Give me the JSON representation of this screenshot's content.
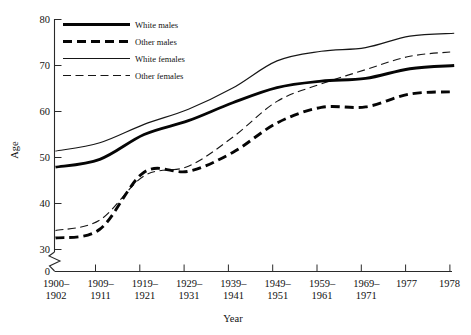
{
  "chart_data": {
    "type": "line",
    "title": "",
    "xlabel": "Year",
    "ylabel": "Age",
    "grid": false,
    "legend_position": "top-left-inside",
    "categories": [
      "1900–1902",
      "1909–1911",
      "1919–1921",
      "1929–1931",
      "1939–1941",
      "1949–1951",
      "1959–1961",
      "1969–1971",
      "1977",
      "1978"
    ],
    "ylim": [
      30,
      80
    ],
    "y_axis_break": true,
    "y_break_from": 0,
    "y_break_to": 30,
    "yticks": [
      0,
      30,
      40,
      50,
      60,
      70,
      80
    ],
    "ytick_labels": [
      "0",
      "30",
      "40",
      "50",
      "60",
      "70",
      "80"
    ],
    "series": [
      {
        "name": "White males",
        "style": "thick-solid",
        "values": [
          47.9,
          49.6,
          55.0,
          58.0,
          61.9,
          65.2,
          66.6,
          67.2,
          69.3,
          70.0
        ]
      },
      {
        "name": "Other males",
        "style": "thick-dashed",
        "values": [
          32.5,
          34.4,
          46.8,
          47.0,
          51.1,
          57.5,
          60.9,
          61.0,
          63.8,
          64.3
        ]
      },
      {
        "name": "White females",
        "style": "thin-solid",
        "values": [
          51.4,
          53.2,
          57.2,
          60.5,
          65.1,
          71.0,
          73.1,
          73.9,
          76.4,
          77.0
        ]
      },
      {
        "name": "Other females",
        "style": "thin-dashed",
        "values": [
          34.1,
          36.4,
          46.0,
          48.1,
          54.4,
          62.2,
          66.0,
          69.1,
          72.0,
          73.0
        ]
      }
    ]
  },
  "axes": {
    "x_title": "Year",
    "y_title": "Age",
    "x_tick_labels": [
      {
        "line1": "1900–",
        "line2": "1902"
      },
      {
        "line1": "1909–",
        "line2": "1911"
      },
      {
        "line1": "1919–",
        "line2": "1921"
      },
      {
        "line1": "1929–",
        "line2": "1931"
      },
      {
        "line1": "1939–",
        "line2": "1941"
      },
      {
        "line1": "1949–",
        "line2": "1951"
      },
      {
        "line1": "1959–",
        "line2": "1961"
      },
      {
        "line1": "1969–",
        "line2": "1971"
      },
      {
        "line1": "1977",
        "line2": ""
      },
      {
        "line1": "1978",
        "line2": ""
      }
    ],
    "y_tick_labels": [
      "80",
      "70",
      "60",
      "50",
      "40",
      "30",
      "0"
    ]
  },
  "legend": {
    "items": [
      {
        "label": "White males",
        "style": "thick-solid"
      },
      {
        "label": "Other males",
        "style": "thick-dashed"
      },
      {
        "label": "White females",
        "style": "thin-solid"
      },
      {
        "label": "Other females",
        "style": "thin-dashed"
      }
    ]
  },
  "colors": {
    "ink": "#050505",
    "axis": "#2a2a2a",
    "background": "#ffffff"
  }
}
